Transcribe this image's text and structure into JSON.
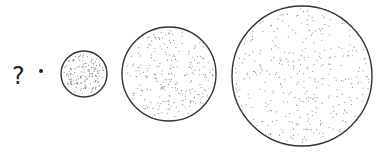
{
  "sequence": {
    "unknown_label": "?",
    "items": [
      {
        "name": "dot",
        "cx": 41,
        "cy": 71,
        "r": 2
      },
      {
        "name": "small-circle",
        "cx": 84,
        "cy": 74,
        "r": 23,
        "dots": 150
      },
      {
        "name": "medium-circle",
        "cx": 169,
        "cy": 74,
        "r": 47,
        "dots": 230
      },
      {
        "name": "large-circle",
        "cx": 302,
        "cy": 76,
        "r": 70,
        "dots": 320
      }
    ]
  },
  "colors": {
    "stroke": "#333333",
    "stipple": "#777777"
  }
}
